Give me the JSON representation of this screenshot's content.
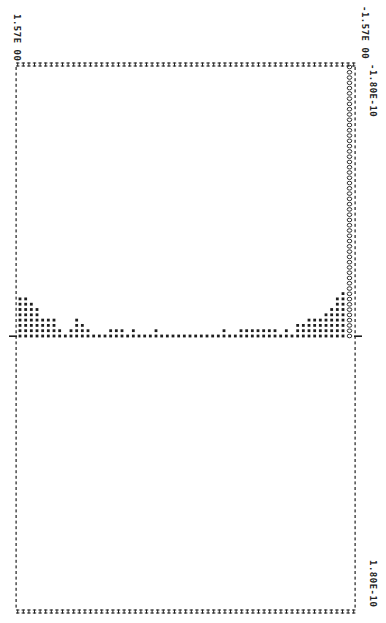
{
  "chart_data": {
    "type": "bar",
    "style": "line-printer dot histogram, rotated 90 degrees clockwise",
    "title": "",
    "xlabel": "",
    "ylabel": "",
    "x_axis": {
      "min_label": "-1.80E-10",
      "max_label": "1.80E-10",
      "range": [
        -1.8e-10,
        1.8e-10
      ]
    },
    "y_axis": {
      "min_label": "-1.57E 00",
      "max_label": "1.57E 00",
      "range": [
        -1.57,
        1.57
      ]
    },
    "annotations": [
      "column of 'O' characters marking the left edge bin at -1.80E-10 (full height stack)"
    ],
    "categories_note": "bins ordered from y = 1.57 (image left) to y = -1.57 (image right); values = number of stacked dots above baseline",
    "values": [
      8,
      8,
      7,
      6,
      4,
      4,
      4,
      2,
      1,
      2,
      4,
      3,
      2,
      1,
      1,
      1,
      2,
      2,
      2,
      1,
      2,
      1,
      1,
      1,
      2,
      1,
      1,
      1,
      1,
      1,
      1,
      1,
      1,
      1,
      1,
      1,
      2,
      1,
      1,
      2,
      2,
      2,
      2,
      2,
      2,
      2,
      1,
      2,
      1,
      3,
      3,
      4,
      4,
      4,
      5,
      6,
      8,
      9
    ],
    "o_column_height": 52,
    "grid": false,
    "legend": null
  },
  "labels": {
    "top_left": "1.57E 00",
    "top_right": "-1.57E 00",
    "right_top": "-1.80E-10",
    "right_bottom": "1.80E-10"
  }
}
